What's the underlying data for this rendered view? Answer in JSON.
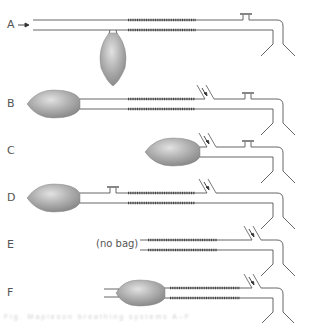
{
  "diagram": {
    "colors": {
      "tube": "#555555",
      "coil": "#444444",
      "bag_light": "#d4d4d4",
      "bag_dark": "#8a8a8a",
      "label": "#555555"
    },
    "rows": [
      {
        "label": "A",
        "label_y": 18,
        "y_top": 20,
        "y_bot": 30,
        "x_start": 33,
        "coil": [
          128,
          196
        ],
        "valve_x": 246,
        "bag": {
          "type": "hanging",
          "cx": 113,
          "cy": 58,
          "rx": 13,
          "ry": 27
        },
        "inlet_x": null,
        "fresh_gas_arrow": true
      },
      {
        "label": "B",
        "label_y": 97,
        "y_top": 99,
        "y_bot": 109,
        "x_start": 80,
        "coil": [
          128,
          195
        ],
        "valve_x": 248,
        "bag": {
          "type": "inline",
          "x0": 27,
          "x1": 80,
          "ry": 14
        },
        "inlet_x": 205
      },
      {
        "label": "C",
        "label_y": 144,
        "y_top": 147,
        "y_bot": 157,
        "x_start": 200,
        "coil": null,
        "valve_x": 248,
        "bag": {
          "type": "inline",
          "x0": 145,
          "x1": 200,
          "ry": 14
        },
        "inlet_x": 207
      },
      {
        "label": "D",
        "label_y": 191,
        "y_top": 193,
        "y_bot": 203,
        "x_start": 80,
        "coil": [
          128,
          195
        ],
        "valve_x": 113,
        "bag": {
          "type": "inline",
          "x0": 27,
          "x1": 80,
          "ry": 14
        },
        "inlet_x": 207
      },
      {
        "label": "E",
        "label_y": 238,
        "y_top": 240,
        "y_bot": 250,
        "x_start": 140,
        "coil": [
          148,
          217
        ],
        "valve_x": null,
        "bag": null,
        "no_bag_text": "(no bag)",
        "inlet_x": 252
      },
      {
        "label": "F",
        "label_y": 286,
        "y_top": 288,
        "y_bot": 298,
        "x_start": 163,
        "coil": [
          170,
          240
        ],
        "valve_x": null,
        "bag": {
          "type": "open",
          "x0": 113,
          "x1": 165,
          "ry": 13,
          "tail_x": 104
        },
        "inlet_x": 252
      }
    ],
    "caption": "Fig. Mapleson breathing systems A–F"
  }
}
